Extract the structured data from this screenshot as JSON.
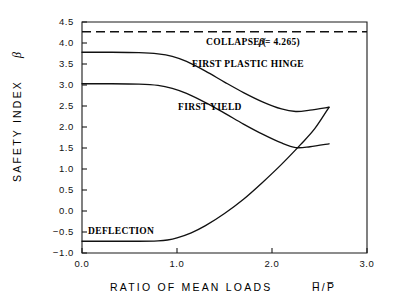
{
  "chart_data": {
    "type": "line",
    "title": "",
    "xlabel": "RATIO OF MEAN LOADS  H̅/P̅",
    "xlabel_text": "RATIO OF MEAN LOADS",
    "xlabel_symbol": "H̅/P̅",
    "ylabel": "SAFETY INDEX β",
    "ylabel_text": "SAFETY INDEX",
    "ylabel_symbol": "β",
    "xlim": [
      0.0,
      3.0
    ],
    "ylim": [
      -1.0,
      4.5
    ],
    "grid": false,
    "legend_position": "inline-annotations",
    "xticks": [
      "0.0",
      "1.0",
      "2.0",
      "3.0"
    ],
    "xtick_values": [
      0.0,
      1.0,
      2.0,
      3.0
    ],
    "yticks": [
      "4.5",
      "4.0",
      "3.5",
      "3.0",
      "2.5",
      "2.0",
      "1.5",
      "1.0",
      "0.5",
      "0.0",
      "−0.5",
      "−1.0"
    ],
    "ytick_values": [
      4.5,
      4.0,
      3.5,
      3.0,
      2.5,
      2.0,
      1.5,
      1.0,
      0.5,
      0.0,
      -0.5,
      -1.0
    ],
    "series": [
      {
        "name": "COLLAPSE",
        "label": "COLLAPSE (β = 4.265)",
        "label_prefix": "COLLAPSE (",
        "label_symbol": "β",
        "label_suffix": " = 4.265)",
        "style": "dashed",
        "beta_value": 4.265,
        "x": [
          0.0,
          3.0
        ],
        "values": [
          4.265,
          4.265
        ]
      },
      {
        "name": "FIRST PLASTIC HINGE",
        "label": "FIRST PLASTIC HINGE",
        "style": "solid",
        "x": [
          0.0,
          0.3,
          0.6,
          0.8,
          0.95,
          1.1,
          1.3,
          1.5,
          1.7,
          1.9,
          2.1,
          2.25,
          2.4,
          2.6
        ],
        "values": [
          3.78,
          3.78,
          3.77,
          3.74,
          3.68,
          3.56,
          3.33,
          3.07,
          2.82,
          2.6,
          2.43,
          2.37,
          2.4,
          2.47
        ]
      },
      {
        "name": "FIRST YIELD",
        "label": "FIRST YIELD",
        "style": "solid",
        "x": [
          0.0,
          0.3,
          0.6,
          0.8,
          0.95,
          1.1,
          1.3,
          1.5,
          1.7,
          1.9,
          2.1,
          2.25,
          2.4,
          2.6
        ],
        "values": [
          3.03,
          3.03,
          3.02,
          2.99,
          2.92,
          2.8,
          2.58,
          2.33,
          2.07,
          1.83,
          1.62,
          1.51,
          1.53,
          1.6
        ]
      },
      {
        "name": "DEFLECTION",
        "label": "DEFLECTION",
        "style": "solid",
        "x": [
          0.0,
          0.3,
          0.6,
          0.8,
          0.9,
          1.0,
          1.15,
          1.3,
          1.5,
          1.7,
          1.9,
          2.1,
          2.3,
          2.45,
          2.6
        ],
        "values": [
          -0.72,
          -0.72,
          -0.72,
          -0.71,
          -0.69,
          -0.64,
          -0.52,
          -0.35,
          -0.06,
          0.28,
          0.68,
          1.11,
          1.58,
          1.96,
          2.47
        ]
      }
    ],
    "annotations": [
      {
        "name": "collapse-label",
        "text": "COLLAPSE (β = 4.265)",
        "x": 1.55,
        "y": 4.03
      },
      {
        "name": "first-plastic-hinge-label",
        "text": "FIRST PLASTIC HINGE",
        "x": 1.2,
        "y": 3.27
      },
      {
        "name": "first-yield-label",
        "text": "FIRST YIELD",
        "x": 1.0,
        "y": 2.44
      },
      {
        "name": "deflection-label",
        "text": "DEFLECTION",
        "x": 0.12,
        "y": -0.5
      }
    ],
    "colors": {
      "curve": "#111111",
      "axis": "#1a1a1a",
      "background": "#ffffff"
    }
  }
}
